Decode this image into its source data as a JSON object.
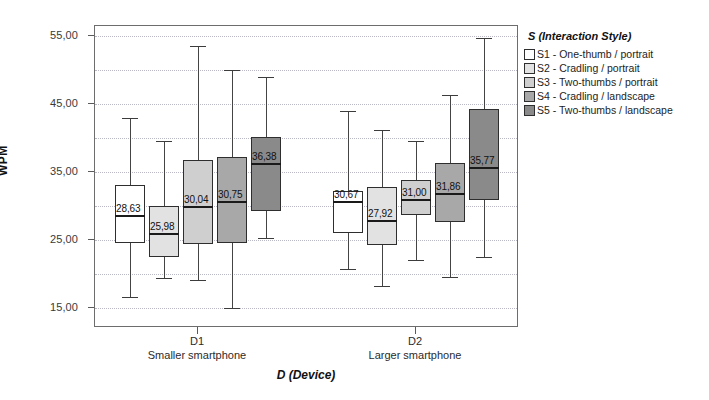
{
  "chart_data": {
    "type": "box",
    "title": "",
    "xlabel": "D (Device)",
    "ylabel": "WPM",
    "ylim": [
      12.0,
      56.5
    ],
    "yticks": [
      15,
      25,
      35,
      45,
      55
    ],
    "ytick_labels": [
      "15,00",
      "25,00",
      "35,00",
      "45,00",
      "55,00"
    ],
    "grid": "horizontal-dotted",
    "legend_position": "right",
    "legend_title": "S (Interaction Style)",
    "groups": [
      {
        "code": "D1",
        "desc": "Smaller smartphone"
      },
      {
        "code": "D2",
        "desc": "Larger smartphone"
      }
    ],
    "series": [
      {
        "name": "S1 - One-thumb / portrait",
        "color": "#ffffff",
        "boxes": [
          {
            "group": "D1",
            "label": "28,63",
            "whisker_low": 16.5,
            "q1": 24.5,
            "median": 28.63,
            "q3": 33.1,
            "whisker_high": 42.9
          },
          {
            "group": "D2",
            "label": "30,67",
            "whisker_low": 20.7,
            "q1": 26.0,
            "median": 30.67,
            "q3": 32.2,
            "whisker_high": 44.0
          }
        ]
      },
      {
        "name": "S2 - Cradling / portrait",
        "color": "#e2e2e2",
        "boxes": [
          {
            "group": "D1",
            "label": "25,98",
            "whisker_low": 19.4,
            "q1": 22.4,
            "median": 25.98,
            "q3": 30.0,
            "whisker_high": 39.5
          },
          {
            "group": "D2",
            "label": "27,92",
            "whisker_low": 18.2,
            "q1": 24.3,
            "median": 27.92,
            "q3": 32.8,
            "whisker_high": 41.2
          }
        ]
      },
      {
        "name": "S3 - Two-thumbs / portrait",
        "color": "#cfcfcf",
        "boxes": [
          {
            "group": "D1",
            "label": "30,04",
            "whisker_low": 19.0,
            "q1": 24.4,
            "median": 30.04,
            "q3": 36.8,
            "whisker_high": 53.5
          },
          {
            "group": "D2",
            "label": "31,00",
            "whisker_low": 22.0,
            "q1": 28.6,
            "median": 31.0,
            "q3": 33.8,
            "whisker_high": 39.6
          }
        ]
      },
      {
        "name": "S4 - Cradling / landscape",
        "color": "#a8a8a8",
        "boxes": [
          {
            "group": "D1",
            "label": "30,75",
            "whisker_low": 15.0,
            "q1": 24.5,
            "median": 30.75,
            "q3": 37.2,
            "whisker_high": 50.0
          },
          {
            "group": "D2",
            "label": "31,86",
            "whisker_low": 19.5,
            "q1": 27.6,
            "median": 31.86,
            "q3": 36.3,
            "whisker_high": 46.4
          }
        ]
      },
      {
        "name": "S5 - Two-thumbs / landscape",
        "color": "#8a8a8a",
        "boxes": [
          {
            "group": "D1",
            "label": "36,38",
            "whisker_low": 25.3,
            "q1": 29.2,
            "median": 36.38,
            "q3": 40.1,
            "whisker_high": 49.0
          },
          {
            "group": "D2",
            "label": "35,77",
            "whisker_low": 22.4,
            "q1": 30.8,
            "median": 35.77,
            "q3": 44.2,
            "whisker_high": 54.8
          }
        ]
      }
    ]
  },
  "axes": {
    "y_title": "WPM",
    "x_title": "D (Device)",
    "y_tick_labels": [
      "55,00",
      "45,00",
      "35,00",
      "25,00",
      "15,00"
    ],
    "x_groups": [
      {
        "code": "D1",
        "desc": "Smaller smartphone"
      },
      {
        "code": "D2",
        "desc": "Larger smartphone"
      }
    ]
  },
  "legend": {
    "title": "S (Interaction Style)",
    "items": [
      {
        "label": "S1 - One-thumb / portrait",
        "color": "#ffffff"
      },
      {
        "label": "S2 - Cradling / portrait",
        "color": "#e2e2e2"
      },
      {
        "label": "S3 - Two-thumbs / portrait",
        "color": "#cfcfcf"
      },
      {
        "label": "S4 - Cradling / landscape",
        "color": "#a8a8a8"
      },
      {
        "label": "S5 - Two-thumbs / landscape",
        "color": "#8a8a8a"
      }
    ]
  }
}
